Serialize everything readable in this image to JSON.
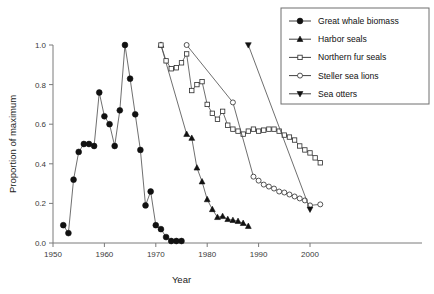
{
  "chart_data": {
    "type": "line",
    "title": "",
    "xlabel": "Year",
    "ylabel": "Proportion of maximum",
    "xlim": [
      1950,
      2005
    ],
    "ylim": [
      0.0,
      1.0
    ],
    "xticks": [
      1950,
      1960,
      1970,
      1980,
      1990,
      2000
    ],
    "xticklabels": [
      "1950",
      "1960",
      "1970",
      "1980",
      "1990",
      "2000"
    ],
    "yticks": [
      0.0,
      0.2,
      0.4,
      0.6,
      0.8,
      1.0
    ],
    "yticklabels": [
      "0.0",
      "0.2",
      "0.4",
      "0.6",
      "0.8",
      "1.0"
    ],
    "grid": false,
    "legend_position": "upper right",
    "series": [
      {
        "name": "Great whale biomass",
        "marker": "filled-circle",
        "x": [
          1952,
          1953,
          1954,
          1955,
          1956,
          1957,
          1958,
          1959,
          1960,
          1961,
          1962,
          1963,
          1964,
          1965,
          1966,
          1967,
          1968,
          1969,
          1970,
          1971,
          1972,
          1973,
          1974,
          1975
        ],
        "y": [
          0.09,
          0.05,
          0.32,
          0.46,
          0.5,
          0.5,
          0.49,
          0.76,
          0.64,
          0.6,
          0.49,
          0.67,
          1.0,
          0.83,
          0.65,
          0.47,
          0.19,
          0.26,
          0.09,
          0.07,
          0.03,
          0.01,
          0.01,
          0.01
        ]
      },
      {
        "name": "Harbor seals",
        "marker": "filled-triangle-up",
        "x": [
          1971,
          1976,
          1977,
          1978,
          1979,
          1980,
          1981,
          1982,
          1983,
          1984,
          1985,
          1986,
          1987,
          1988
        ],
        "y": [
          1.0,
          0.55,
          0.53,
          0.38,
          0.31,
          0.22,
          0.17,
          0.13,
          0.135,
          0.12,
          0.115,
          0.11,
          0.1,
          0.085
        ]
      },
      {
        "name": "Northern fur seals",
        "marker": "open-square",
        "x": [
          1971,
          1972,
          1973,
          1974,
          1975,
          1976,
          1977,
          1978,
          1979,
          1980,
          1981,
          1982,
          1983,
          1984,
          1985,
          1986,
          1987,
          1988,
          1989,
          1990,
          1991,
          1992,
          1993,
          1994,
          1995,
          1996,
          1997,
          1998,
          1999,
          2000,
          2001,
          2002
        ],
        "y": [
          1.0,
          0.92,
          0.88,
          0.885,
          0.91,
          0.955,
          0.77,
          0.8,
          0.815,
          0.7,
          0.655,
          0.625,
          0.665,
          0.595,
          0.575,
          0.565,
          0.55,
          0.565,
          0.575,
          0.565,
          0.57,
          0.575,
          0.575,
          0.565,
          0.545,
          0.535,
          0.52,
          0.49,
          0.47,
          0.455,
          0.43,
          0.405
        ]
      },
      {
        "name": "Steller sea lions",
        "marker": "open-circle",
        "x": [
          1976,
          1985,
          1989,
          1990,
          1991,
          1992,
          1993,
          1994,
          1995,
          1996,
          1997,
          1998,
          1999,
          2000,
          2002
        ],
        "y": [
          1.0,
          0.71,
          0.335,
          0.315,
          0.295,
          0.285,
          0.275,
          0.26,
          0.255,
          0.245,
          0.235,
          0.225,
          0.215,
          0.19,
          0.195
        ]
      },
      {
        "name": "Sea otters",
        "marker": "filled-triangle-down",
        "x": [
          1988,
          2000
        ],
        "y": [
          1.0,
          0.17
        ]
      }
    ]
  },
  "legend": {
    "entries": [
      {
        "label": "Great whale biomass",
        "marker": "filled-circle"
      },
      {
        "label": "Harbor seals",
        "marker": "filled-triangle-up"
      },
      {
        "label": "Northern fur seals",
        "marker": "open-square"
      },
      {
        "label": "Steller sea lions",
        "marker": "open-circle"
      },
      {
        "label": "Sea otters",
        "marker": "filled-triangle-down"
      }
    ]
  }
}
